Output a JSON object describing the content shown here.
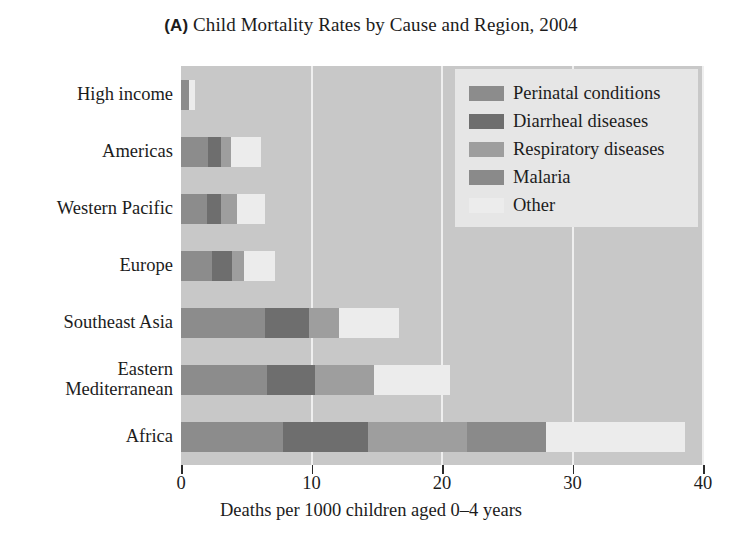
{
  "chart_data": {
    "type": "bar",
    "orientation": "horizontal",
    "stacked": true,
    "title": "Child Mortality Rates by Cause and Region, 2004",
    "panel_letter": "(A)",
    "xlabel": "Deaths per 1000 children aged 0–4 years",
    "ylabel": "",
    "xlim": [
      0,
      40
    ],
    "xticks": [
      0,
      10,
      20,
      30,
      40
    ],
    "xticklabels": [
      "0",
      "10",
      "20",
      "30",
      "40"
    ],
    "grid": true,
    "grid_axis": "x",
    "legend_position": "top-right",
    "categories": [
      "High income",
      "Americas",
      "Western Pacific",
      "Europe",
      "Southeast Asia",
      "Eastern Mediterranean",
      "Africa"
    ],
    "category_lines": [
      [
        "High income"
      ],
      [
        "Americas"
      ],
      [
        "Western Pacific"
      ],
      [
        "Europe"
      ],
      [
        "Southeast Asia"
      ],
      [
        "Eastern",
        "Mediterranean"
      ],
      [
        "Africa"
      ]
    ],
    "series": [
      {
        "name": "Perinatal conditions",
        "color": "#8c8c8c",
        "values": [
          0.6,
          2.1,
          2.0,
          2.4,
          6.4,
          6.6,
          7.8
        ]
      },
      {
        "name": "Diarrheal diseases",
        "color": "#6e6e6e",
        "values": [
          0.0,
          1.0,
          1.1,
          1.5,
          3.4,
          3.7,
          6.5
        ]
      },
      {
        "name": "Respiratory diseases",
        "color": "#9e9e9e",
        "values": [
          0.0,
          0.7,
          1.2,
          0.9,
          2.3,
          4.5,
          7.6
        ]
      },
      {
        "name": "Malaria",
        "color": "#8a8a8a",
        "values": [
          0.0,
          0.0,
          0.0,
          0.0,
          0.0,
          0.0,
          6.1
        ]
      },
      {
        "name": "Other",
        "color": "#ececec",
        "values": [
          0.5,
          2.3,
          2.1,
          2.4,
          4.6,
          5.8,
          10.6
        ]
      }
    ],
    "totals": [
      1.1,
      6.1,
      6.4,
      7.2,
      16.7,
      20.6,
      38.6
    ],
    "plot_background": "#c8c8c8",
    "gridline_color": "#efefef"
  }
}
